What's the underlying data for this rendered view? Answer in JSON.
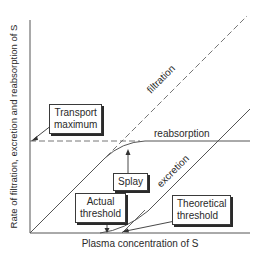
{
  "diagram": {
    "axes": {
      "y_label": "Rate of filtration, excretion and reabsorption of S",
      "x_label": "Plasma concentration of S"
    },
    "curves": {
      "filtration": "filtration",
      "reabsorption": "reabsorption",
      "excretion": "excretion"
    },
    "callouts": {
      "transport_maximum": [
        "Transport",
        "maximum"
      ],
      "splay": "Splay",
      "actual_threshold": [
        "Actual",
        "threshold"
      ],
      "theoretical_threshold": [
        "Theoretical",
        "threshold"
      ]
    },
    "colors": {
      "line": "#555555",
      "text": "#2a2a2a",
      "background": "#ffffff"
    }
  }
}
